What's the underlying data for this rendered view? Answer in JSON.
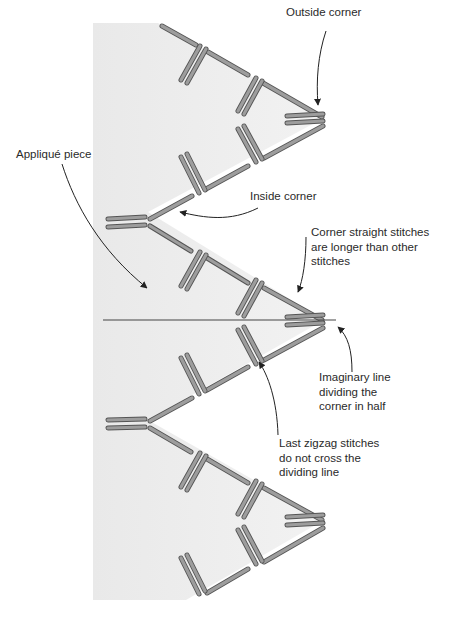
{
  "header": {
    "text": ""
  },
  "colors": {
    "applique_fill": "#ececec",
    "stitch_fill": "#9a9a9a",
    "stitch_outline": "#555555",
    "annotation_line": "#222222",
    "text": "#2a2a2a"
  },
  "labels": {
    "outside_corner": "Outside corner",
    "applique_piece": "Appliqué piece",
    "inside_corner": "Inside corner",
    "corner_straight_stitches": "Corner straight stitches\nare longer than other\nstitches",
    "imaginary_line": "Imaginary line\ndividing the\ncorner in half",
    "last_zigzag": "Last zigzag stitches\ndo not cross the\ndividing line"
  }
}
